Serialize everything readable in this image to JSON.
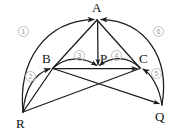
{
  "figure": {
    "caption": "Semicircle geometry construction with vertices A, B, P, C, R, Q and six numbered arcs",
    "stroke_color": "#1a1a1a",
    "label_color": "#111111",
    "circled_label_color": "#9b9b9b",
    "circled_label_border": "#bdbdbd",
    "background_color": "#ffffff",
    "width": 178,
    "height": 136
  },
  "vertices": [
    {
      "id": "A",
      "label": "A",
      "x": 97,
      "y": 19,
      "label_x": 92,
      "label_y": 1
    },
    {
      "id": "B",
      "label": "B",
      "x": 53,
      "y": 68,
      "label_x": 42,
      "label_y": 52
    },
    {
      "id": "P",
      "label": "P",
      "x": 98,
      "y": 68,
      "label_x": 100,
      "label_y": 52
    },
    {
      "id": "C",
      "label": "C",
      "x": 140,
      "y": 68,
      "label_x": 139,
      "label_y": 52
    },
    {
      "id": "R",
      "label": "R",
      "x": 23,
      "y": 112,
      "label_x": 16,
      "label_y": 117
    },
    {
      "id": "Q",
      "label": "Q",
      "x": 162,
      "y": 105,
      "label_x": 155,
      "label_y": 110
    }
  ],
  "arcs": [
    {
      "id": "arc1",
      "label": "①",
      "from": "R",
      "to": "A",
      "label_x": 18,
      "label_y": 26,
      "description": "outer left semicircle arc R to A, arrow at A"
    },
    {
      "id": "arc2",
      "label": "②",
      "from": "R",
      "to": "B",
      "label_x": 25,
      "label_y": 71,
      "description": "inner arc R to B, arrow at B"
    },
    {
      "id": "arc3",
      "label": "③",
      "from": "B",
      "to": "P",
      "label_x": 74,
      "label_y": 50,
      "description": "inner arc B to P, arrow at P"
    },
    {
      "id": "arc4",
      "label": "④",
      "from": "C",
      "to": "P",
      "label_x": 111,
      "label_y": 50,
      "description": "inner arc C to P, arrow at P"
    },
    {
      "id": "arc5",
      "label": "⑤",
      "from": "Q",
      "to": "C",
      "label_x": 151,
      "label_y": 68,
      "description": "inner arc Q to C, arrow at C"
    },
    {
      "id": "arc6",
      "label": "⑥",
      "from": "Q",
      "to": "A",
      "label_x": 153,
      "label_y": 26,
      "description": "outer right semicircle arc Q to A, arrow at A"
    }
  ],
  "segments": [
    {
      "id": "seg-A-B",
      "from": "A",
      "to": "B",
      "description": "straight line from apex A down-left to B"
    },
    {
      "id": "seg-A-P",
      "from": "A",
      "to": "P",
      "description": "vertical straight line from apex A down to P, arrow at P"
    },
    {
      "id": "seg-A-C",
      "from": "A",
      "to": "C",
      "description": "straight line from apex A down-right to C"
    },
    {
      "id": "seg-B-C",
      "from": "B",
      "to": "C",
      "description": "horizontal straight chord B through P to C, arrow at C"
    },
    {
      "id": "seg-R-C",
      "from": "R",
      "to": "C",
      "description": "straight line R up-right to C crossing B-Q"
    },
    {
      "id": "seg-B-Q",
      "from": "B",
      "to": "Q",
      "description": "straight line B down-right to Q crossing R-C, arrow at Q"
    },
    {
      "id": "seg-R-B",
      "from": "R",
      "to": "B",
      "description": "straight line R up-right to B"
    }
  ],
  "intersection": {
    "id": "cross-point",
    "x": 98,
    "y": 82,
    "description": "crossing of R-C and B-Q"
  }
}
